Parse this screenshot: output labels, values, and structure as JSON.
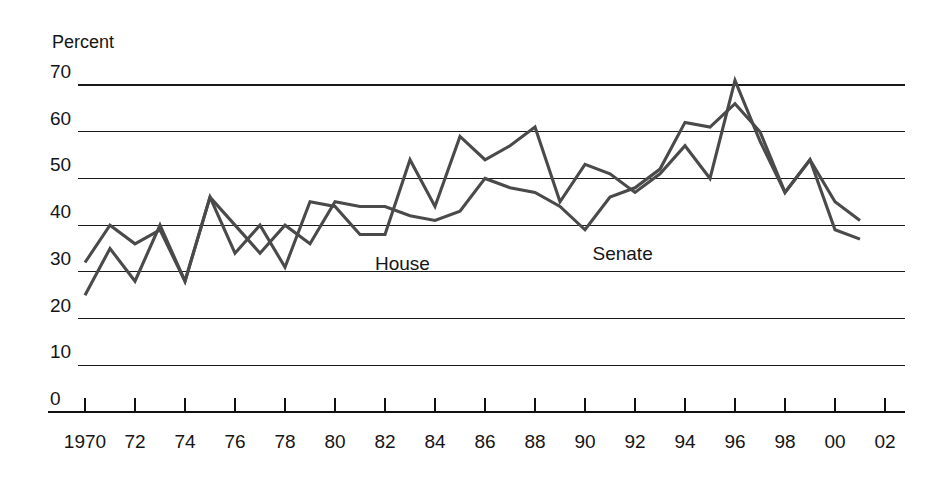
{
  "chart_data": {
    "type": "line",
    "title": "",
    "subtitle": "",
    "xlabel": "",
    "ylabel": "Percent",
    "ylim": [
      0,
      70
    ],
    "xlim": [
      1970,
      2002
    ],
    "grid": true,
    "legend_position": "inline-annotation",
    "y_ticks": [
      "70",
      "60",
      "50",
      "40",
      "30",
      "20",
      "10",
      "0"
    ],
    "y_tick_values": [
      70,
      60,
      50,
      40,
      30,
      20,
      10,
      0
    ],
    "x_ticks": [
      "1970",
      "72",
      "74",
      "76",
      "78",
      "80",
      "82",
      "84",
      "86",
      "88",
      "90",
      "92",
      "94",
      "96",
      "98",
      "00",
      "02"
    ],
    "x_tick_values": [
      1970,
      1972,
      1974,
      1976,
      1978,
      1980,
      1982,
      1984,
      1986,
      1988,
      1990,
      1992,
      1994,
      1996,
      1998,
      2000,
      2002
    ],
    "x": [
      1970,
      1971,
      1972,
      1973,
      1974,
      1975,
      1976,
      1977,
      1978,
      1979,
      1980,
      1981,
      1982,
      1983,
      1984,
      1985,
      1986,
      1987,
      1988,
      1989,
      1990,
      1991,
      1992,
      1993,
      1994,
      1995,
      1996,
      1997,
      1998,
      1999,
      2000,
      2001
    ],
    "series": [
      {
        "name": "House",
        "color": "#4a4a4a",
        "label": "House",
        "label_x": 1981.6,
        "label_y": 30.5,
        "values": [
          32,
          40,
          36,
          39,
          28,
          46,
          40,
          34,
          40,
          36,
          45,
          44,
          44,
          42,
          41,
          43,
          50,
          48,
          47,
          44,
          39,
          46,
          48,
          52,
          62,
          61,
          66,
          60,
          47,
          54,
          45,
          41
        ]
      },
      {
        "name": "Senate",
        "color": "#4a4a4a",
        "label": "Senate",
        "label_x": 1990.3,
        "label_y": 32.5,
        "values": [
          25,
          35,
          28,
          40,
          28,
          46,
          34,
          40,
          31,
          45,
          44,
          38,
          38,
          54,
          44,
          59,
          54,
          57,
          61,
          45,
          53,
          51,
          47,
          51,
          57,
          50,
          71,
          58,
          47,
          54,
          39,
          37
        ]
      }
    ],
    "annotations": [
      {
        "text": "House",
        "x": 1981.6,
        "y": 30.5
      },
      {
        "text": "Senate",
        "x": 1990.3,
        "y": 32.5
      }
    ]
  },
  "axis": {
    "y_title": "Percent"
  },
  "colors": {
    "line": "#4a4a4a",
    "grid": "#1a1a1a",
    "axis": "#111111",
    "text": "#151515",
    "background": "#ffffff"
  }
}
